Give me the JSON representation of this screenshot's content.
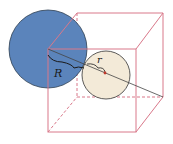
{
  "diagram": {
    "labels": {
      "big_radius": "R",
      "small_radius": "r"
    },
    "colors": {
      "cube": "#d9788a",
      "big_sphere": "#5b84bb",
      "small_sphere": "#f3ead8",
      "outline": "#333333",
      "point": "#c0392b"
    }
  }
}
